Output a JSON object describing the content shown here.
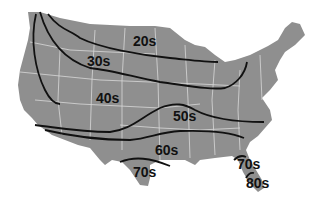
{
  "map": {
    "subject": "United States temperature zones",
    "colors": {
      "land": "#8f8f8f",
      "state_borders": "#d8d8d8",
      "isolines": "#111111",
      "background": "#ffffff"
    },
    "zone_labels": [
      {
        "id": "20s",
        "text": "20s",
        "x": 133,
        "y": 46
      },
      {
        "id": "30s",
        "text": "30s",
        "x": 87,
        "y": 66
      },
      {
        "id": "40s",
        "text": "40s",
        "x": 96,
        "y": 103
      },
      {
        "id": "50s",
        "text": "50s",
        "x": 173,
        "y": 121
      },
      {
        "id": "60s",
        "text": "60s",
        "x": 155,
        "y": 155
      },
      {
        "id": "70s-texas",
        "text": "70s",
        "x": 133,
        "y": 177
      },
      {
        "id": "70s-florida",
        "text": "70s",
        "x": 237,
        "y": 169
      },
      {
        "id": "80s",
        "text": "80s",
        "x": 246,
        "y": 188
      }
    ]
  }
}
